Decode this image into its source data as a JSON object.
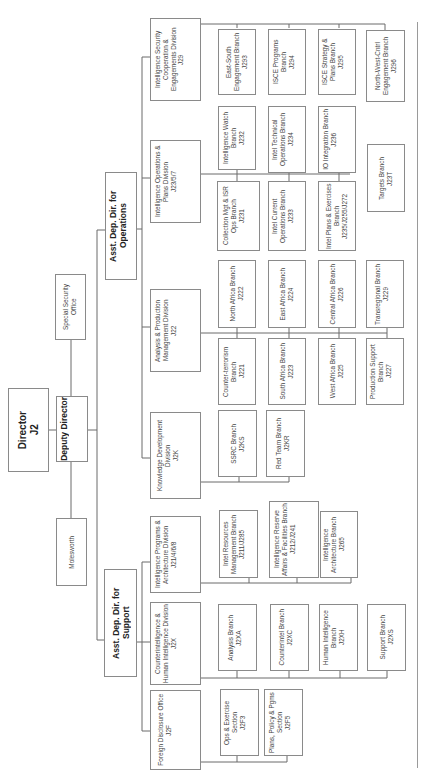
{
  "chart": {
    "orientation": "rotated 90 degrees counter-clockwise (text reads bottom-to-top)",
    "top": {
      "director": {
        "label": "Director",
        "code": "J2"
      },
      "deputy": {
        "label": "Deputy Director"
      },
      "special_security": {
        "label": "Special Security Office"
      },
      "molesworth": {
        "label": "Molesworth"
      }
    },
    "operations": {
      "label": "Asst. Dep. Dir. for Operations",
      "divisions": [
        {
          "label": "Intelligence Security Cooperation & Engagements Division",
          "code": "J29",
          "branches": [
            {
              "label": "East-South Engagement Branch",
              "code": "J293"
            },
            {
              "label": "ISCE Programs Branch",
              "code": "J294"
            },
            {
              "label": "ISCE Strategy & Plans Branch",
              "code": "J295"
            },
            {
              "label": "North-West-Cntrl Engagement Branch",
              "code": "J296"
            }
          ]
        },
        {
          "label": "Intelligence Operations & Plans Division",
          "code": "J23/5/7",
          "branches": [
            {
              "label": "Collection Mgt & ISR Ops Branch",
              "code": "J231"
            },
            {
              "label": "Intelligence Watch Branch",
              "code": "J232"
            },
            {
              "label": "Intel Current Operations Branch",
              "code": "J233"
            },
            {
              "label": "Intel Technical Operations Branch",
              "code": "J234"
            },
            {
              "label": "Intel Plans & Exercises Branch",
              "code": "J235/J255/J272"
            },
            {
              "label": "IO Integration Branch",
              "code": "J236"
            },
            {
              "label": "Targets Branch",
              "code": "J23T"
            }
          ]
        },
        {
          "label": "Analysis & Production Management Division",
          "code": "J22",
          "branches": [
            {
              "label": "Counter-terrorism Branch",
              "code": "J221"
            },
            {
              "label": "North Africa Branch",
              "code": "J222"
            },
            {
              "label": "South Africa Branch",
              "code": "J223"
            },
            {
              "label": "East Africa Branch",
              "code": "J224"
            },
            {
              "label": "West Africa Branch",
              "code": "J225"
            },
            {
              "label": "Central Africa Branch",
              "code": "J226"
            },
            {
              "label": "Production Support Branch",
              "code": "J227"
            },
            {
              "label": "Transregional Branch",
              "code": "J229"
            }
          ]
        },
        {
          "label": "Knowledge Development Division",
          "code": "J2K",
          "branches": [
            {
              "label": "SSRC Branch",
              "code": "J2KS"
            },
            {
              "label": "Red Team Branch",
              "code": "J2KR"
            }
          ]
        }
      ]
    },
    "support": {
      "label": "Asst. Dep. Dir. for Support",
      "divisions": [
        {
          "label": "Intelligence Programs & Architecture Division",
          "code": "J21/4/6/8",
          "branches": [
            {
              "label": "Intel Resources Management Branch",
              "code": "J211/J285"
            },
            {
              "label": "Intelligence Reserve Affairs & Facilities Branch",
              "code": "J212/J241"
            },
            {
              "label": "Intelligence Architecture Branch",
              "code": "J265"
            }
          ]
        },
        {
          "label": "Counterintelligence & Human Intelligence Division",
          "code": "J2X",
          "branches": [
            {
              "label": "Analysis Branch",
              "code": "J2XA"
            },
            {
              "label": "Counterintel Branch",
              "code": "J2XC"
            },
            {
              "label": "Human Intelligence Branch",
              "code": "J2XH"
            },
            {
              "label": "Support Branch",
              "code": "J2XS"
            }
          ]
        },
        {
          "label": "Foreign Disclosure Office",
          "code": "J2F",
          "branches": [
            {
              "label": "Ops & Exercise Section",
              "code": "J2F3"
            },
            {
              "label": "Plans, Policy & Pgms Section",
              "code": "J2F5"
            }
          ]
        }
      ]
    }
  }
}
